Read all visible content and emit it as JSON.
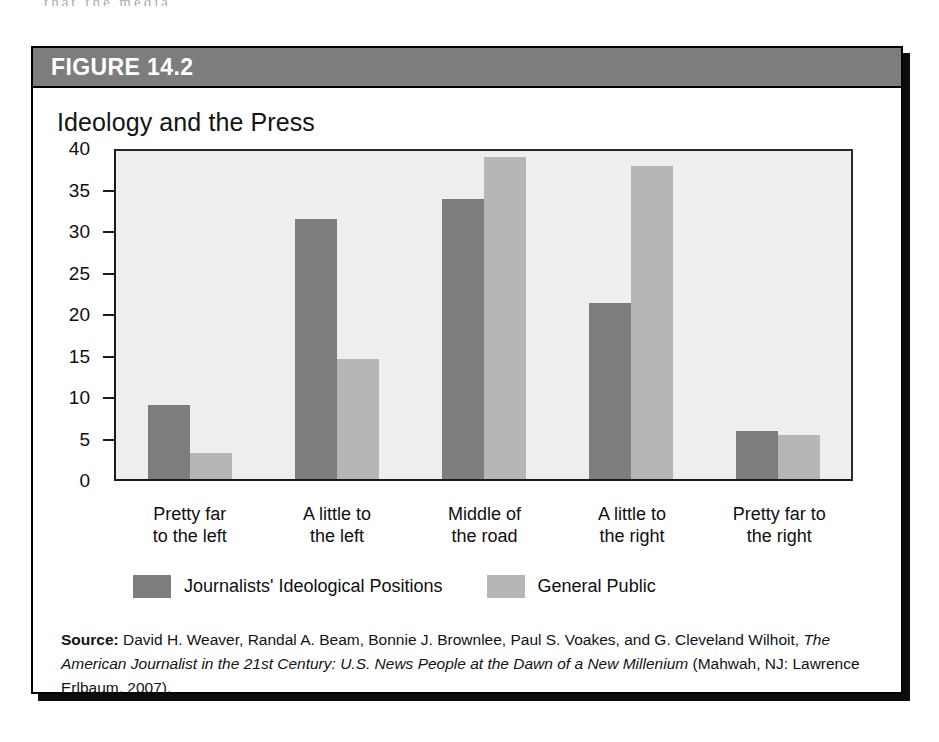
{
  "page_bleed_text": "that the media",
  "figure": {
    "number_label": "FIGURE 14.2",
    "title": "Ideology and the Press",
    "header_bg": "#7d7d7d",
    "plot_bg": "#eeeeee"
  },
  "legend": {
    "entries": [
      {
        "label": "Journalists' Ideological Positions",
        "color": "#7d7d7d"
      },
      {
        "label": "General Public",
        "color": "#b6b6b6"
      }
    ]
  },
  "source": {
    "label": "Source:",
    "text_part_1": " David H. Weaver, Randal A. Beam, Bonnie J. Brownlee, Paul S. Voakes, and G. Cleveland Wilhoit, ",
    "title_italic": "The American Journalist in the 21st Century: U.S. News People at the Dawn of a New Millenium",
    "text_part_2": " (Mahwah, NJ: Lawrence Erlbaum, 2007)."
  },
  "chart_data": {
    "type": "bar",
    "title": "Ideology and the Press",
    "xlabel": "",
    "ylabel": "",
    "ylim": [
      0,
      40
    ],
    "yticks": [
      0,
      5,
      10,
      15,
      20,
      25,
      30,
      35,
      40
    ],
    "grid": false,
    "legend_position": "bottom-left",
    "categories": [
      "Pretty far\nto the left",
      "A little to\nthe left",
      "Middle of\nthe road",
      "A little to\nthe right",
      "Pretty far to\nthe right"
    ],
    "category_lines": [
      [
        "Pretty far",
        "to the left"
      ],
      [
        "A little to",
        "the left"
      ],
      [
        "Middle of",
        "the road"
      ],
      [
        "A little to",
        "the right"
      ],
      [
        "Pretty far to",
        "the right"
      ]
    ],
    "series": [
      {
        "name": "Journalists' Ideological Positions",
        "color": "#7d7d7d",
        "values": [
          9,
          31.5,
          34,
          21.3,
          5.8
        ]
      },
      {
        "name": "General Public",
        "color": "#b6b6b6",
        "values": [
          3.2,
          14.5,
          39,
          38,
          5.3
        ]
      }
    ]
  }
}
